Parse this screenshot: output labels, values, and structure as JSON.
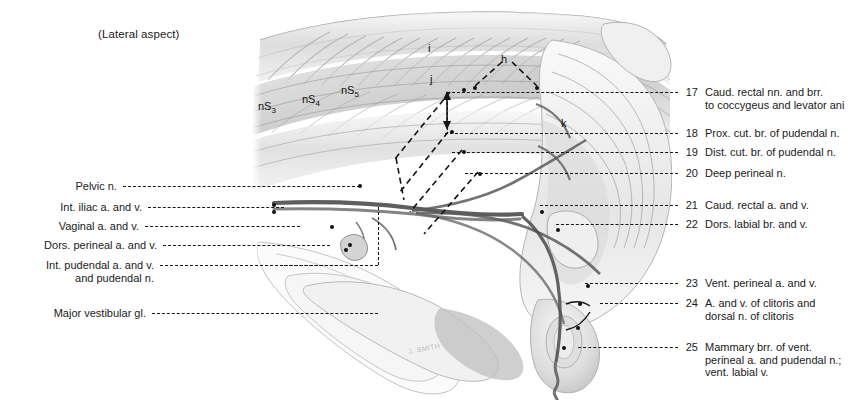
{
  "plate": {
    "aspect_note": "(Lateral aspect)",
    "background_color": "#ffffff",
    "ink_color": "#141414",
    "artist_signature": "J. SMITH"
  },
  "illustration": {
    "description": "Graphite anatomical drawing, lateral aspect of the bovine female pelvis showing pudendal and caudal rectal nerves and vessels",
    "inline_annotations": [
      {
        "id": "nS3",
        "text": "nS",
        "subscript": "3",
        "x": 258,
        "y": 100
      },
      {
        "id": "nS4",
        "text": "nS",
        "subscript": "4",
        "x": 302,
        "y": 93
      },
      {
        "id": "nS5",
        "text": "nS",
        "subscript": "5",
        "x": 341,
        "y": 84
      },
      {
        "id": "i",
        "text": "i",
        "subscript": "",
        "x": 428,
        "y": 42
      },
      {
        "id": "h",
        "text": "h",
        "subscript": "",
        "x": 501,
        "y": 53
      },
      {
        "id": "j",
        "text": "j",
        "subscript": "",
        "x": 430,
        "y": 73
      },
      {
        "id": "k",
        "text": "k",
        "subscript": "",
        "x": 561,
        "y": 117
      }
    ]
  },
  "labels_left": [
    {
      "num": "",
      "lines": [
        "Pelvic n."
      ],
      "y": 180,
      "leader_y": 186,
      "leader_x1": 123,
      "leader_x2": 360
    },
    {
      "num": "6",
      "lines": [
        "Int. iliac a. and v."
      ],
      "y": 201,
      "leader_y": 207,
      "leader_x1": 148,
      "leader_x2": 284
    },
    {
      "num": "7",
      "lines": [
        "Vaginal a. and v."
      ],
      "y": 220,
      "leader_y": 226,
      "leader_x1": 145,
      "leader_x2": 300
    },
    {
      "num": "8",
      "lines": [
        "Dors. perineal a. and v."
      ],
      "y": 239,
      "leader_y": 245,
      "leader_x1": 163,
      "leader_x2": 330
    },
    {
      "num": "9",
      "lines": [
        "Int. pudendal a. and v.",
        "and pudendal n."
      ],
      "y": 259,
      "leader_y": 265,
      "leader_x1": 160,
      "leader_x2": 378
    },
    {
      "num": "10",
      "lines": [
        "Major vestibular gl."
      ],
      "y": 307,
      "leader_y": 313,
      "leader_x1": 152,
      "leader_x2": 378
    }
  ],
  "labels_right": [
    {
      "num": "17",
      "lines": [
        "Caud. rectal nn. and brr.",
        "to coccygeus and levator ani"
      ],
      "y": 86,
      "leader_y": 92,
      "leader_x1": 447,
      "leader_x2": 678
    },
    {
      "num": "18",
      "lines": [
        "Prox. cut. br. of pudendal n."
      ],
      "y": 127,
      "leader_y": 133,
      "leader_x1": 445,
      "leader_x2": 678
    },
    {
      "num": "19",
      "lines": [
        "Dist. cut. br. of pudendal n."
      ],
      "y": 146,
      "leader_y": 152,
      "leader_x1": 452,
      "leader_x2": 678
    },
    {
      "num": "20",
      "lines": [
        "Deep perineal n."
      ],
      "y": 167,
      "leader_y": 173,
      "leader_x1": 465,
      "leader_x2": 678
    },
    {
      "num": "21",
      "lines": [
        "Caud. rectal a. and v."
      ],
      "y": 199,
      "leader_y": 205,
      "leader_x1": 540,
      "leader_x2": 678
    },
    {
      "num": "22",
      "lines": [
        "Dors. labial br. and v."
      ],
      "y": 218,
      "leader_y": 224,
      "leader_x1": 556,
      "leader_x2": 678
    },
    {
      "num": "23",
      "lines": [
        "Vent. perineal a. and v."
      ],
      "y": 277,
      "leader_y": 283,
      "leader_x1": 585,
      "leader_x2": 678
    },
    {
      "num": "24",
      "lines": [
        "A. and v. of clitoris and",
        "dorsal n. of clitoris"
      ],
      "y": 297,
      "leader_y": 303,
      "leader_x1": 600,
      "leader_x2": 678
    },
    {
      "num": "25",
      "lines": [
        "Mammary brr. of vent.",
        "perineal a. and pudendal n.;",
        "vent. labial v."
      ],
      "y": 341,
      "leader_y": 347,
      "leader_x1": 578,
      "leader_x2": 678
    }
  ]
}
